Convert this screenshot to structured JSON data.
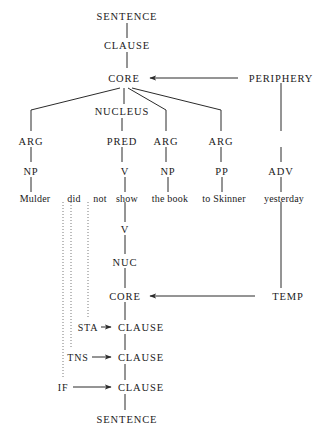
{
  "diagram": {
    "sentence_text": "Mulder did not show the book to Skinner yesterday",
    "colors": {
      "line": "#2b2b2b",
      "dotted_line": "#7a7a7a",
      "text": "#1a1a1a",
      "background": "#ffffff"
    },
    "constituent_projection": {
      "top_sentence": "SENTENCE",
      "top_clause": "CLAUSE",
      "core": "CORE",
      "periphery": "PERIPHERY",
      "nucleus": "NUCLEUS",
      "arg_1": "ARG",
      "pred": "PRED",
      "arg_2": "ARG",
      "arg_3": "ARG",
      "np_1": "NP",
      "v_1": "V",
      "np_2": "NP",
      "pp_1": "PP",
      "adv_1": "ADV"
    },
    "words": [
      {
        "text": "Mulder"
      },
      {
        "text": "did"
      },
      {
        "text": "not"
      },
      {
        "text": "show"
      },
      {
        "text": "the book"
      },
      {
        "text": "to Skinner"
      },
      {
        "text": "yesterday"
      }
    ],
    "operator_projection": {
      "v": "V",
      "nuc": "NUC",
      "core": "CORE",
      "clause_sta": "CLAUSE",
      "clause_tns": "CLAUSE",
      "clause_if": "CLAUSE",
      "sentence": "SENTENCE",
      "temp": "TEMP",
      "sta": "STA",
      "tns": "TNS",
      "if": "IF"
    }
  }
}
